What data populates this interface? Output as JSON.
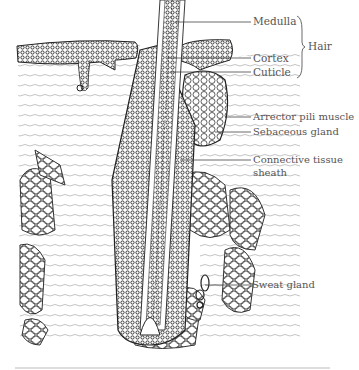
{
  "diagram": {
    "labels": [
      {
        "id": "medulla",
        "text": "Medulla"
      },
      {
        "id": "cortex",
        "text": "Cortex"
      },
      {
        "id": "cuticle",
        "text": "Cuticle"
      },
      {
        "id": "hair",
        "text": "Hair"
      },
      {
        "id": "arrector",
        "text": "Arrector pili muscle"
      },
      {
        "id": "sebaceous",
        "text": "Sebaceous gland"
      },
      {
        "id": "connective_1",
        "text": "Connective tissue"
      },
      {
        "id": "connective_2",
        "text": "sheath"
      },
      {
        "id": "sweat",
        "text": "Sweat gland"
      }
    ],
    "colors": {
      "ink": "#333333",
      "label": "#555555",
      "background": "#ffffff"
    }
  }
}
